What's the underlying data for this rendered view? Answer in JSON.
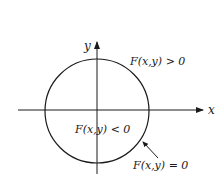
{
  "diagram": {
    "type": "implicit-curve-regions",
    "axes": {
      "x_label": "x",
      "y_label": "y"
    },
    "curve": {
      "shape": "circle",
      "label": "F(x,y) = 0"
    },
    "regions": {
      "outside_label": "F(x,y) > 0",
      "inside_label": "F(x,y) < 0"
    },
    "colors": {
      "ink": "#1a1a1a",
      "background": "#ffffff"
    }
  }
}
